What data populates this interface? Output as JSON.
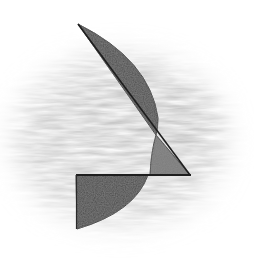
{
  "artwork": {
    "medium": "pencil sketch",
    "subject": "abstract geometric figure: circular segments and triangles",
    "colors": {
      "paper": "#ffffff",
      "smudge": "#d8d8d8",
      "fill": "#4a4a4a",
      "fill_light": "#7a7a7a",
      "line": "#1e1e1e"
    }
  }
}
